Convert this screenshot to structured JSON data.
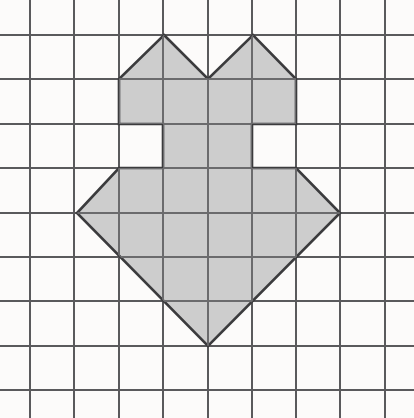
{
  "figure": {
    "background_color": "#fdfdfd",
    "shape": {
      "name": "shaded-polygon",
      "fill_color": "#c9c9c9",
      "outline_color": "#3b3b3d",
      "outline_width": 2.6,
      "vertices": [
        [
          164,
          35
        ],
        [
          208,
          79
        ],
        [
          253,
          35
        ],
        [
          296,
          79
        ],
        [
          296,
          124
        ],
        [
          252,
          124
        ],
        [
          252,
          168
        ],
        [
          296,
          168
        ],
        [
          340,
          213
        ],
        [
          208,
          346
        ],
        [
          77,
          213
        ],
        [
          119,
          168
        ],
        [
          163,
          168
        ],
        [
          163,
          124
        ],
        [
          119,
          124
        ],
        [
          119,
          79
        ]
      ]
    },
    "grid": {
      "line_color": "#5a5a5c",
      "line_width": 1.4,
      "cell_width": 44.3,
      "cell_height": 44.3,
      "vertical_lines": [
        30,
        74,
        119,
        163,
        208,
        252,
        296,
        340,
        385
      ],
      "horizontal_lines": [
        35,
        79,
        124,
        168,
        213,
        257,
        301,
        346,
        390
      ],
      "columns": 9,
      "rows": 9
    },
    "canvas": {
      "width": 414,
      "height": 418
    }
  }
}
